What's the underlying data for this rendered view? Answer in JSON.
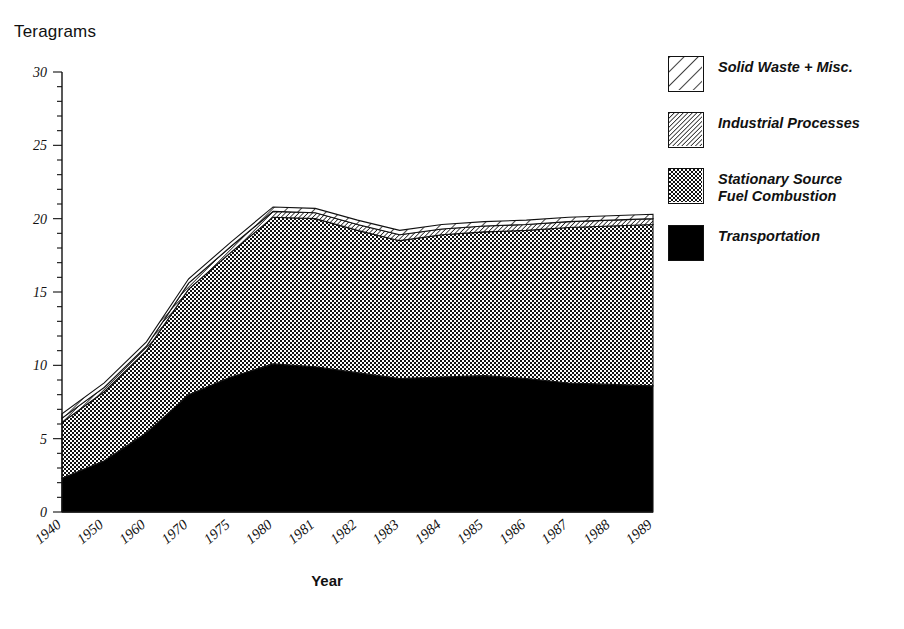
{
  "chart_data": {
    "type": "area",
    "title": "",
    "subtitle": "",
    "ylabel": "Teragrams",
    "xlabel": "Year",
    "ylim": [
      0,
      30
    ],
    "ytick_values": [
      0,
      5,
      10,
      15,
      20,
      25,
      30
    ],
    "ytick_labels": [
      "0",
      "5",
      "10",
      "15",
      "20",
      "25",
      "30"
    ],
    "yminor_step": 1,
    "grid": false,
    "legend_position": "right",
    "stacked": true,
    "categories": [
      "1940",
      "1950",
      "1960",
      "1970",
      "1975",
      "1980",
      "1981",
      "1982",
      "1983",
      "1984",
      "1985",
      "1986",
      "1987",
      "1988",
      "1989"
    ],
    "series": [
      {
        "name": "Transportation",
        "pattern": "solid-black",
        "color": "#000000",
        "values": [
          2.3,
          3.5,
          5.4,
          8.0,
          9.2,
          10.1,
          9.9,
          9.5,
          9.1,
          9.2,
          9.3,
          9.1,
          8.8,
          8.7,
          8.6
        ]
      },
      {
        "name": "Stationary Source\nFuel Combustion",
        "pattern": "checkerboard",
        "color": "#7a7a7a",
        "values": [
          3.8,
          4.7,
          5.6,
          7.2,
          8.5,
          10.0,
          10.1,
          9.7,
          9.4,
          9.7,
          9.8,
          10.1,
          10.6,
          10.8,
          11.0
        ]
      },
      {
        "name": "Industrial Processes",
        "pattern": "fine-diagonal",
        "color": "#b4b4b4",
        "values": [
          0.3,
          0.3,
          0.3,
          0.4,
          0.4,
          0.4,
          0.4,
          0.4,
          0.4,
          0.4,
          0.4,
          0.4,
          0.4,
          0.4,
          0.4
        ]
      },
      {
        "name": "Solid Waste + Misc.",
        "pattern": "wide-diagonal",
        "color": "#ffffff",
        "values": [
          0.3,
          0.3,
          0.3,
          0.3,
          0.3,
          0.3,
          0.3,
          0.3,
          0.3,
          0.3,
          0.3,
          0.3,
          0.3,
          0.3,
          0.3
        ]
      }
    ],
    "totals": [
      6.7,
      8.8,
      11.6,
      15.9,
      18.4,
      20.8,
      20.7,
      19.9,
      19.2,
      19.6,
      19.8,
      19.9,
      20.1,
      20.2,
      20.3
    ],
    "annotations": []
  },
  "legend": {
    "items": [
      {
        "label": "Solid Waste + Misc.",
        "pattern": "wide-diagonal"
      },
      {
        "label": "Industrial Processes",
        "pattern": "fine-diagonal"
      },
      {
        "label": "Stationary Source\nFuel Combustion",
        "pattern": "checkerboard"
      },
      {
        "label": "Transportation",
        "pattern": "solid-black"
      }
    ]
  },
  "colors": {
    "axis": "#111111",
    "transportation": "#000000",
    "stationary": "#7a7a7a",
    "industrial": "#b4b4b4",
    "solid_waste": "#ffffff",
    "background": "#ffffff"
  }
}
